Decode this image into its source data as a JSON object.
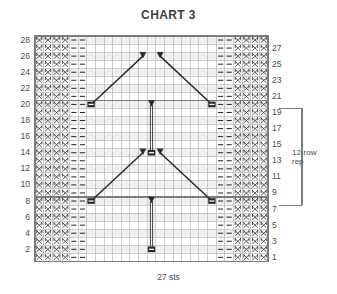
{
  "title": "CHART 3",
  "bottom_label": "27 sts",
  "repeat_label_line1": "12-row",
  "repeat_label_line2": "rep",
  "grid": {
    "columns": 27,
    "rows": 28,
    "x0": 35,
    "y0": 36,
    "cell_w": 8.63,
    "cell_h": 8.05
  },
  "row_numbers_left": [
    "28",
    "26",
    "24",
    "22",
    "20",
    "18",
    "16",
    "14",
    "12",
    "10",
    "8",
    "6",
    "4",
    "2"
  ],
  "row_numbers_right": [
    "27",
    "25",
    "23",
    "21",
    "19",
    "17",
    "15",
    "13",
    "11",
    "9",
    "7",
    "5",
    "3",
    "1"
  ],
  "repeat_bracket": {
    "top_row": 19,
    "bottom_row": 7
  },
  "symbols": {
    "seed": "X",
    "purl": "–",
    "knot": "knot-symbol",
    "arrow": "arrowhead-symbol"
  },
  "colors": {
    "grid_line": "#b9b9b9",
    "grid_heavy": "#7d7d7d",
    "shade": "#f0f0f0",
    "ink": "#2b2b2b",
    "text": "#4a4a4a"
  },
  "chart_data": {
    "type": "table",
    "title": "CHART 3",
    "xlabel": "27 sts",
    "ylabel": "",
    "seed_columns_left": [
      1,
      2,
      3,
      4
    ],
    "purl_columns_left": [
      5,
      6
    ],
    "purl_columns_right": [
      22,
      23
    ],
    "seed_columns_right": [
      24,
      25,
      26,
      27
    ],
    "knots": [
      {
        "col": 7,
        "row": 20
      },
      {
        "col": 21,
        "row": 20
      },
      {
        "col": 14,
        "row": 14
      },
      {
        "col": 7,
        "row": 8
      },
      {
        "col": 21,
        "row": 8
      },
      {
        "col": 14,
        "row": 2
      }
    ],
    "arrowheads": [
      {
        "col": 13,
        "row": 26
      },
      {
        "col": 15,
        "row": 26
      },
      {
        "col": 14,
        "row": 20
      },
      {
        "col": 13,
        "row": 14
      },
      {
        "col": 15,
        "row": 14
      },
      {
        "col": 14,
        "row": 8
      }
    ],
    "travelling_lines": [
      {
        "from_col": 7,
        "from_row": 20,
        "to_col": 13,
        "to_row": 26
      },
      {
        "from_col": 21,
        "from_row": 20,
        "to_col": 15,
        "to_row": 26
      },
      {
        "from_col": 7,
        "from_row": 8,
        "to_col": 13,
        "to_row": 14
      },
      {
        "from_col": 21,
        "from_row": 8,
        "to_col": 15,
        "to_row": 14
      }
    ],
    "vertical_lines": [
      {
        "col": 14,
        "from_row": 14,
        "to_row": 20
      },
      {
        "col": 14,
        "from_row": 2,
        "to_row": 8
      }
    ],
    "heavy_rows": [
      20,
      8
    ]
  }
}
